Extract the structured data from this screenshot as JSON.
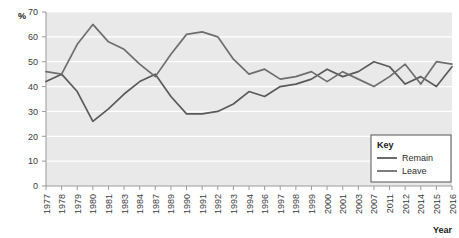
{
  "chart_data": {
    "type": "line",
    "title": "",
    "xlabel": "Year",
    "ylabel": "%",
    "ylim": [
      0,
      70
    ],
    "yticks": [
      0,
      10,
      20,
      30,
      40,
      50,
      60,
      70
    ],
    "grid": true,
    "legend_position": "bottom-right",
    "legend_title": "Key",
    "plot_background": "#e9e9e9",
    "gridline_color": "#ffffff",
    "categories": [
      "1977",
      "1978",
      "1979",
      "1980",
      "1981",
      "1983",
      "1984",
      "1987",
      "1989",
      "1990",
      "1991",
      "1992",
      "1993",
      "1994",
      "1996",
      "1997",
      "1998",
      "1999",
      "2000",
      "2001",
      "2003",
      "2007",
      "2011",
      "2012",
      "2014",
      "2015",
      "2016"
    ],
    "series": [
      {
        "name": "Remain",
        "color": "#5a5a5a",
        "values": [
          42,
          45,
          38,
          26,
          31,
          37,
          42,
          45,
          36,
          29,
          29,
          30,
          33,
          38,
          36,
          40,
          41,
          43,
          47,
          44,
          46,
          50,
          48,
          41,
          44,
          40,
          48
        ]
      },
      {
        "name": "Leave",
        "color": "#6e6e6e",
        "values": [
          46,
          45,
          57,
          65,
          58,
          55,
          49,
          44,
          53,
          61,
          62,
          60,
          51,
          45,
          47,
          43,
          44,
          46,
          42,
          46,
          43,
          40,
          44,
          49,
          41,
          50,
          49
        ]
      }
    ]
  },
  "axes": {
    "y_unit_label": "%",
    "x_axis_label": "Year"
  },
  "legend": {
    "title": "Key",
    "entries": [
      {
        "label": "Remain"
      },
      {
        "label": "Leave"
      }
    ]
  }
}
